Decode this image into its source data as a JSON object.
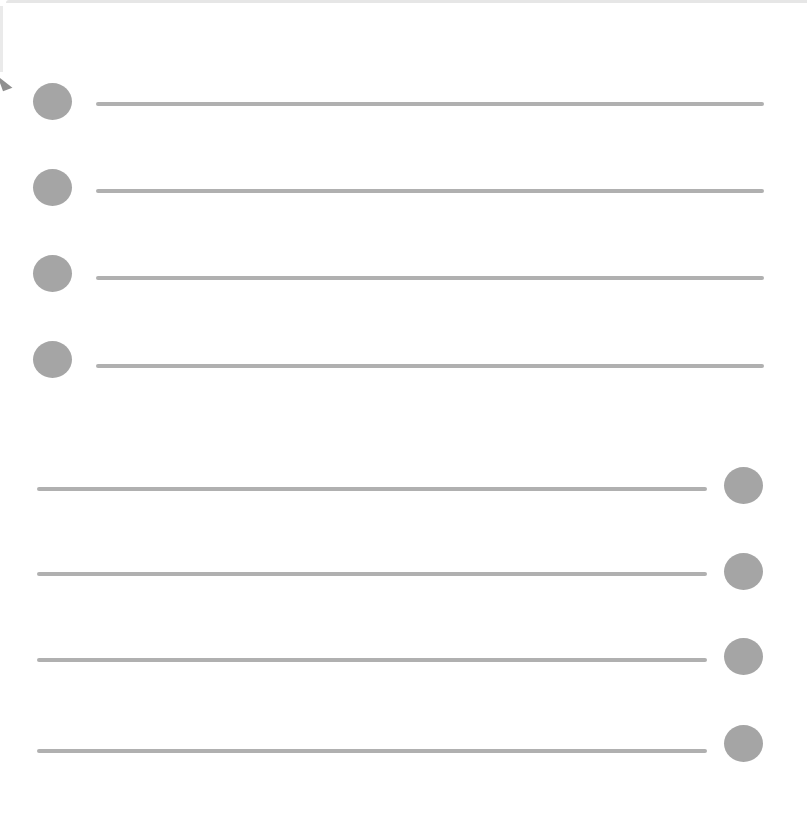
{
  "colors": {
    "background": "#ffffff",
    "dot": "#a5a5a5",
    "line": "#b0b0b0",
    "frame": "#e6e6e6"
  },
  "top_group": [
    {
      "dot_x": 33,
      "dot_y": 83,
      "line_x": 96,
      "line_y": 102,
      "line_w": 668
    },
    {
      "dot_x": 33,
      "dot_y": 169,
      "line_x": 96,
      "line_y": 189,
      "line_w": 668
    },
    {
      "dot_x": 33,
      "dot_y": 255,
      "line_x": 96,
      "line_y": 276,
      "line_w": 668
    },
    {
      "dot_x": 33,
      "dot_y": 341,
      "line_x": 96,
      "line_y": 364,
      "line_w": 668
    }
  ],
  "bottom_group": [
    {
      "dot_x": 724,
      "dot_y": 467,
      "line_x": 37,
      "line_y": 487,
      "line_w": 670
    },
    {
      "dot_x": 724,
      "dot_y": 553,
      "line_x": 37,
      "line_y": 572,
      "line_w": 670
    },
    {
      "dot_x": 724,
      "dot_y": 638,
      "line_x": 37,
      "line_y": 658,
      "line_w": 670
    },
    {
      "dot_x": 724,
      "dot_y": 725,
      "line_x": 37,
      "line_y": 749,
      "line_w": 670
    }
  ]
}
